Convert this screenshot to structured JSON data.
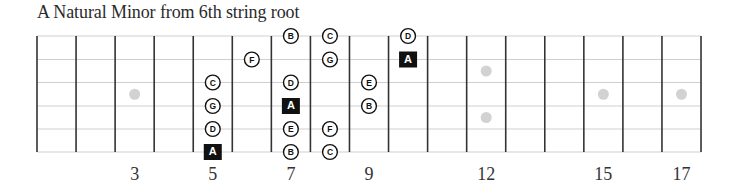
{
  "title": "A Natural Minor from 6th string root",
  "fretboard": {
    "first_fret_line_x": 37,
    "fret_spacing": 39.06,
    "fret_line_count": 18,
    "string_y": [
      36,
      59.5,
      82.5,
      106,
      129,
      152
    ],
    "strings": [
      "1 (high E)",
      "2 (B)",
      "3 (G)",
      "4 (D)",
      "5 (A)",
      "6 (low E)"
    ],
    "colors": {
      "fret_line": "#333333",
      "string_line": "#cfcfcf",
      "inlay": "#d2d2d2",
      "root_fill": "#111111",
      "root_text": "#ffffff",
      "note_border": "#111111",
      "note_text": "#111111"
    }
  },
  "fret_numbers": [
    {
      "fret": 3,
      "label": "3"
    },
    {
      "fret": 5,
      "label": "5"
    },
    {
      "fret": 7,
      "label": "7"
    },
    {
      "fret": 9,
      "label": "9"
    },
    {
      "fret": 12,
      "label": "12"
    },
    {
      "fret": 15,
      "label": "15"
    },
    {
      "fret": 17,
      "label": "17"
    }
  ],
  "inlays": [
    {
      "fret": 3,
      "between": [
        3,
        4
      ]
    },
    {
      "fret": 12,
      "between": [
        2,
        3
      ]
    },
    {
      "fret": 12,
      "between": [
        4,
        5
      ]
    },
    {
      "fret": 15,
      "between": [
        3,
        4
      ]
    },
    {
      "fret": 17,
      "between": [
        3,
        4
      ]
    }
  ],
  "notes": [
    {
      "fret": 5,
      "string": 3,
      "note": "C",
      "root": false
    },
    {
      "fret": 5,
      "string": 4,
      "note": "G",
      "root": false
    },
    {
      "fret": 5,
      "string": 5,
      "note": "D",
      "root": false
    },
    {
      "fret": 5,
      "string": 6,
      "note": "A",
      "root": true
    },
    {
      "fret": 6,
      "string": 2,
      "note": "F",
      "root": false
    },
    {
      "fret": 7,
      "string": 1,
      "note": "B",
      "root": false
    },
    {
      "fret": 7,
      "string": 3,
      "note": "D",
      "root": false
    },
    {
      "fret": 7,
      "string": 4,
      "note": "A",
      "root": true
    },
    {
      "fret": 7,
      "string": 5,
      "note": "E",
      "root": false
    },
    {
      "fret": 7,
      "string": 6,
      "note": "B",
      "root": false
    },
    {
      "fret": 8,
      "string": 1,
      "note": "C",
      "root": false
    },
    {
      "fret": 8,
      "string": 2,
      "note": "G",
      "root": false
    },
    {
      "fret": 8,
      "string": 5,
      "note": "F",
      "root": false
    },
    {
      "fret": 8,
      "string": 6,
      "note": "C",
      "root": false
    },
    {
      "fret": 9,
      "string": 3,
      "note": "E",
      "root": false
    },
    {
      "fret": 9,
      "string": 4,
      "note": "B",
      "root": false
    },
    {
      "fret": 10,
      "string": 1,
      "note": "D",
      "root": false
    },
    {
      "fret": 10,
      "string": 2,
      "note": "A",
      "root": true
    }
  ]
}
